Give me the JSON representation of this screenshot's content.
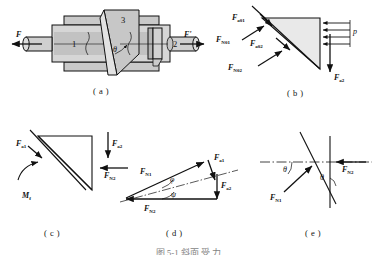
{
  "figure": {
    "title_partial": "图 5-1  斜面 受 力",
    "captions": [
      {
        "id": "a",
        "text": "( a )"
      },
      {
        "id": "b",
        "text": "( b )"
      },
      {
        "id": "c",
        "text": "( c )"
      },
      {
        "id": "d",
        "text": "( d )"
      },
      {
        "id": "e",
        "text": "( e )"
      }
    ]
  },
  "diagram_a": {
    "name": "wedge-mechanism-assembly",
    "part_numbers": [
      "1",
      "2",
      "3"
    ],
    "force_left": "F",
    "force_right": "F'",
    "angle": "θ"
  },
  "diagram_b": {
    "name": "wedge-free-body",
    "labels": {
      "f1": "F",
      "f1_sub": "a01",
      "n1": "F",
      "n1_sub": "N01",
      "f2": "F",
      "f2_sub": "a02",
      "n2": "F",
      "n2_sub": "N02",
      "pressure": "p",
      "axial": "F",
      "axial_sub": "a2"
    }
  },
  "diagram_c": {
    "name": "block-free-body",
    "labels": {
      "fa1": "F",
      "fa1_sub": "a1",
      "fa2": "F",
      "fa2_sub": "a2",
      "fn2": "F",
      "fn2_sub": "N2",
      "mf": "M",
      "mf_sub": "f"
    }
  },
  "diagram_d": {
    "name": "force-triangle",
    "labels": {
      "fn1": "F",
      "fn1_sub": "N1",
      "fn2": "F",
      "fn2_sub": "N2",
      "fa1": "F",
      "fa1_sub": "a1",
      "fa2": "F",
      "fa2_sub": "a2",
      "angle_upper": "φ",
      "angle_lower": "ψ"
    }
  },
  "diagram_e": {
    "name": "normal-force-angles",
    "labels": {
      "fn1": "F",
      "fn1_sub": "N1",
      "fn2": "F",
      "fn2_sub": "N2",
      "angle_left": "θ",
      "angle_right": "θ"
    }
  },
  "colors": {
    "ink": "#111111",
    "fill_light": "#d8d8d8",
    "fill_mid": "#c0c0c0",
    "fill_dark": "#a8a8a8",
    "fill_pale": "#e6e6e6"
  }
}
